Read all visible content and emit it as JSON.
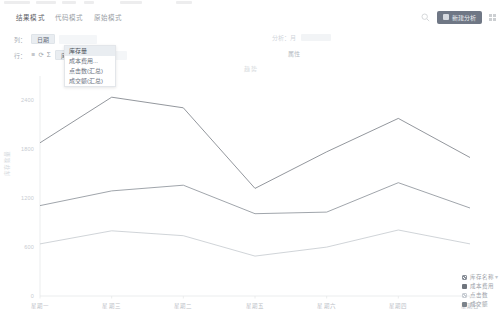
{
  "tabs": [
    {
      "label": "结果模式",
      "active": true
    },
    {
      "label": "代码模式",
      "active": false
    },
    {
      "label": "原始模式",
      "active": false
    }
  ],
  "toolbar": {
    "search_icon": "search-icon",
    "primary_button_label": "新建分析",
    "grid_icon": "grid-menu-icon"
  },
  "shelves": {
    "columns": {
      "label": "列：",
      "pill": "日期"
    },
    "rows": {
      "label": "行：",
      "pill": "库存量"
    },
    "row_icons": [
      "≡",
      "⟳",
      "Σ"
    ],
    "ghost_columns_label": "分析：月",
    "ghost_rows_label": "属性"
  },
  "dropdown": {
    "items": [
      {
        "label": "库存量",
        "selected": true
      },
      {
        "label": "成本费用...",
        "selected": false
      },
      {
        "label": "点击数(汇总)",
        "selected": false
      },
      {
        "label": "成交额(汇总)",
        "selected": false
      }
    ]
  },
  "chart_data": {
    "type": "line",
    "title": "趋势",
    "xlabel": "",
    "ylabel": "库存数量",
    "categories": [
      "星期一",
      "星期三",
      "星期二",
      "星期五",
      "星期六",
      "星期四",
      "星期日"
    ],
    "yticks": [
      "0",
      "600",
      "1200",
      "1800",
      "2400"
    ],
    "ylim": [
      0,
      2700
    ],
    "grid": false,
    "legend_position": "bottom-right",
    "series": [
      {
        "name": "库存名称",
        "color": "#7f848b",
        "values": [
          1880,
          2440,
          2310,
          1320,
          1770,
          2180,
          1700
        ]
      },
      {
        "name": "成本费用",
        "color": "#8f959c",
        "values": [
          1110,
          1290,
          1360,
          1010,
          1030,
          1390,
          1080
        ]
      },
      {
        "name": "点击数",
        "color": "#c8ccd1",
        "values": [
          640,
          800,
          740,
          490,
          600,
          810,
          640
        ]
      },
      {
        "name": "成交额",
        "color": "#9aa0a7",
        "values": [
          null,
          null,
          null,
          null,
          null,
          null,
          null
        ]
      }
    ]
  },
  "legend": {
    "more_icon": "more-icon",
    "items": [
      {
        "label": "库存名称",
        "color": "#8a9099",
        "marker": "hatch"
      },
      {
        "label": "成本费用",
        "color": "#6f757d",
        "marker": "solid"
      },
      {
        "label": "点击数",
        "color": "#c9ced4",
        "marker": "hatch"
      },
      {
        "label": "成交额",
        "color": "#7c838b",
        "marker": "solid"
      }
    ]
  }
}
